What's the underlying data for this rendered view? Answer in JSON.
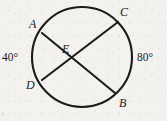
{
  "figure": {
    "name": "circle-two-chords-intersecting",
    "background_color": "#f3f2ef",
    "stroke_color": "#1b1b1b",
    "corner_artifact": "°"
  },
  "circle": {
    "center_x": 82,
    "center_y": 57,
    "radius": 50
  },
  "points": {
    "A": {
      "label": "A",
      "x": 42,
      "y": 33,
      "label_x": 29,
      "label_y": 18
    },
    "B": {
      "label": "B",
      "x": 115,
      "y": 93,
      "label_x": 119,
      "label_y": 97
    },
    "C": {
      "label": "C",
      "x": 118,
      "y": 22,
      "label_x": 120,
      "label_y": 6
    },
    "D": {
      "label": "D",
      "x": 42,
      "y": 80,
      "label_x": 26,
      "label_y": 79
    },
    "E": {
      "label": "E",
      "x": 72,
      "y": 60,
      "label_x": 62,
      "label_y": 43
    }
  },
  "chords": [
    {
      "name": "chord-AB",
      "from": "A",
      "to": "B",
      "x1": 42,
      "y1": 33,
      "x2": 115,
      "y2": 93
    },
    {
      "name": "chord-DC",
      "from": "D",
      "to": "C",
      "x1": 42,
      "y1": 80,
      "x2": 118,
      "y2": 22
    }
  ],
  "arc_labels": {
    "left": {
      "text": "40°",
      "value": 40,
      "unit": "degrees",
      "position": "left-outside",
      "arc": "AD"
    },
    "right": {
      "text": "80°",
      "value": 80,
      "unit": "degrees",
      "position": "right-outside",
      "arc": "CB"
    }
  }
}
